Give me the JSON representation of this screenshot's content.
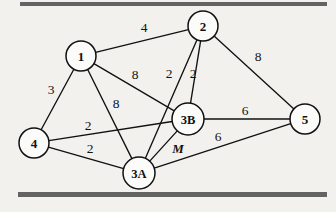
{
  "figure": {
    "type": "weighted-graph-diagram",
    "background_color": "#f2f1ee",
    "line_color": "#111111",
    "rule_color": "#636363",
    "rules": [
      {
        "name": "top-rule",
        "x": 20,
        "y": 2,
        "width": 307,
        "height": 4
      },
      {
        "name": "bottom-rule",
        "x": 18,
        "y": 192,
        "width": 309,
        "height": 5
      }
    ]
  },
  "nodes": [
    {
      "id": "1",
      "label": "1",
      "x": 81,
      "y": 56,
      "r": 15
    },
    {
      "id": "2",
      "label": "2",
      "x": 203,
      "y": 26,
      "r": 15
    },
    {
      "id": "3A",
      "label": "3A",
      "x": 139,
      "y": 173,
      "r": 16
    },
    {
      "id": "3B",
      "label": "3B",
      "x": 188,
      "y": 119,
      "r": 16
    },
    {
      "id": "4",
      "label": "4",
      "x": 34,
      "y": 143,
      "r": 15
    },
    {
      "id": "5",
      "label": "5",
      "x": 305,
      "y": 119,
      "r": 15
    }
  ],
  "edges": [
    {
      "from": "1",
      "to": "2",
      "weight": "4",
      "label_x": 144,
      "label_y": 27
    },
    {
      "from": "1",
      "to": "4",
      "weight": "3",
      "label_x": 51,
      "label_y": 89
    },
    {
      "from": "1",
      "to": "3B",
      "weight": "8",
      "label_x": 135,
      "label_y": 74
    },
    {
      "from": "1",
      "to": "3A",
      "weight": "8",
      "label_x": 116,
      "label_y": 103
    },
    {
      "from": "2",
      "to": "3A",
      "weight": "2",
      "label_x": 169,
      "label_y": 73
    },
    {
      "from": "2",
      "to": "3B",
      "weight": "2",
      "label_x": 193,
      "label_y": 73
    },
    {
      "from": "2",
      "to": "5",
      "weight": "8",
      "label_x": 258,
      "label_y": 56
    },
    {
      "from": "4",
      "to": "3B",
      "weight": "2",
      "label_x": 88,
      "label_y": 125
    },
    {
      "from": "4",
      "to": "3A",
      "weight": "2",
      "label_x": 90,
      "label_y": 148
    },
    {
      "from": "3A",
      "to": "3B",
      "weight": "M",
      "label_x": 178,
      "label_y": 148,
      "italic": true
    },
    {
      "from": "3B",
      "to": "5",
      "weight": "6",
      "label_x": 245,
      "label_y": 110
    },
    {
      "from": "3A",
      "to": "5",
      "weight": "6",
      "label_x": 218,
      "label_y": 136
    }
  ]
}
